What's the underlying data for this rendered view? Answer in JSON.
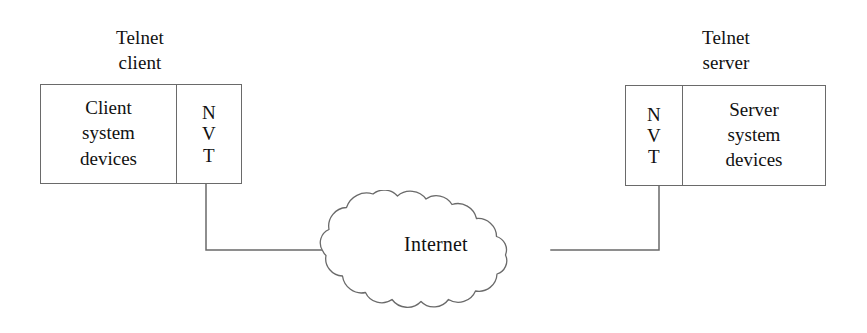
{
  "diagram": {
    "background_color": "#ffffff",
    "stroke_color": "#6a6a6a",
    "text_color": "#111111",
    "canvas": {
      "width": 867,
      "height": 333
    }
  },
  "client_node": {
    "caption": "Telnet\nclient",
    "caption_line1": "Telnet",
    "caption_line2": "client",
    "system_cell": "Client\nsystem\ndevices",
    "system_cell_line1": "Client",
    "system_cell_line2": "system",
    "system_cell_line3": "devices",
    "nvt_cell": "N\nV\nT",
    "nvt_expansion": "NVT"
  },
  "server_node": {
    "caption": "Telnet\nserver",
    "caption_line1": "Telnet",
    "caption_line2": "server",
    "system_cell": "Server\nsystem\ndevices",
    "system_cell_line1": "Server",
    "system_cell_line2": "system",
    "system_cell_line3": "devices",
    "nvt_cell": "N\nV\nT",
    "nvt_expansion": "NVT"
  },
  "network_cloud": {
    "label": "Internet",
    "shape": "cloud"
  },
  "connections": [
    {
      "id": "client-to-internet",
      "from": "client_node",
      "to": "network_cloud",
      "style": "solid"
    },
    {
      "id": "server-to-internet",
      "from": "server_node",
      "to": "network_cloud",
      "style": "solid"
    }
  ]
}
